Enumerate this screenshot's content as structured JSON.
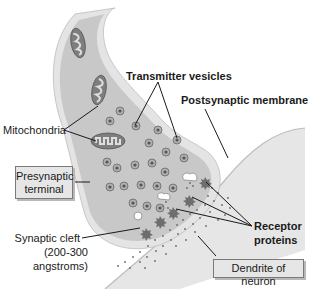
{
  "diagram": {
    "labels": {
      "transmitter_vesicles": "Transmitter vesicles",
      "postsynaptic_membrane": "Postsynaptic membrane",
      "mitochondria": "Mitochondria",
      "presynaptic_terminal_line1": "Presynaptic",
      "presynaptic_terminal_line2": "terminal",
      "synaptic_cleft_line1": "Synaptic cleft",
      "synaptic_cleft_line2": "(200-300",
      "synaptic_cleft_line3": "angstroms)",
      "receptor_proteins_line1": "Receptor",
      "receptor_proteins_line2": "proteins",
      "dendrite": "Dendrite of neuron"
    },
    "colors": {
      "terminal_fill": "#c9c9c9",
      "terminal_outer": "#e4e4e4",
      "dendrite_fill": "#e7e7e7",
      "mitochondria": "#7d7d7d",
      "vesicle": "#8a8a8a",
      "receptor": "#6e6e6e",
      "leader_line": "#1a1a1a"
    }
  }
}
